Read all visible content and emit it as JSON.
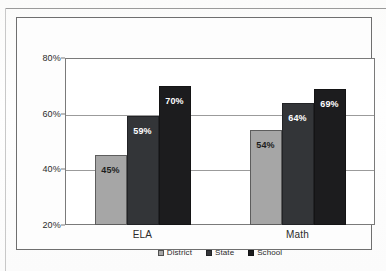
{
  "chart_data": {
    "type": "bar",
    "title": "",
    "xlabel": "",
    "ylabel": "",
    "categories": [
      "ELA",
      "Math"
    ],
    "series": [
      {
        "name": "District",
        "values": [
          45,
          54
        ],
        "color": "#A6A6A6"
      },
      {
        "name": "State",
        "values": [
          59,
          64
        ],
        "color": "#333538"
      },
      {
        "name": "School",
        "values": [
          70,
          69
        ],
        "color": "#1C1C1E"
      }
    ],
    "value_labels": [
      [
        "45%",
        "59%",
        "70%"
      ],
      [
        "54%",
        "64%",
        "69%"
      ]
    ],
    "ylim": [
      20,
      80
    ],
    "yticks": [
      20,
      40,
      60,
      80
    ],
    "ytick_labels": [
      "20%",
      "40%",
      "60%",
      "80%"
    ],
    "grid": true,
    "legend_position": "bottom"
  },
  "legend": {
    "items": [
      {
        "label": "District"
      },
      {
        "label": "State"
      },
      {
        "label": "School"
      }
    ]
  }
}
